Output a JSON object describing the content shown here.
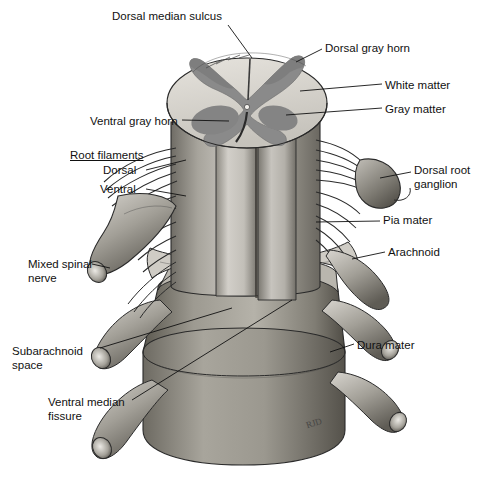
{
  "figure": {
    "background_color": "#ffffff",
    "signature": "RJD"
  },
  "palette": {
    "white_matter": "#d9d6d0",
    "gray_matter": "#8a8a8a",
    "cord_light": "#c9c6c0",
    "cord_mid": "#9c998f",
    "cord_dark": "#6d6a63",
    "dura": "#8e8b82",
    "dura_dark": "#4e4b45",
    "outline": "#2a2a2a",
    "leader": "#111111"
  },
  "labels": [
    {
      "id": "dorsal-median-sulcus",
      "text": "Dorsal median sulcus",
      "x": 112,
      "y": 10,
      "align": "left",
      "underline": false
    },
    {
      "id": "dorsal-gray-horn",
      "text": "Dorsal gray horn",
      "x": 325,
      "y": 42,
      "align": "left",
      "underline": false
    },
    {
      "id": "white-matter",
      "text": "White matter",
      "x": 385,
      "y": 79,
      "align": "left",
      "underline": false
    },
    {
      "id": "gray-matter",
      "text": "Gray matter",
      "x": 385,
      "y": 103,
      "align": "left",
      "underline": false
    },
    {
      "id": "ventral-gray-horn",
      "text": "Ventral gray horn",
      "x": 90,
      "y": 115,
      "align": "left",
      "underline": false
    },
    {
      "id": "root-filaments",
      "text": "Root filaments",
      "x": 70,
      "y": 149,
      "align": "left",
      "underline": true
    },
    {
      "id": "root-filaments-dorsal",
      "text": "Dorsal",
      "x": 103,
      "y": 170,
      "align": "left",
      "underline": false
    },
    {
      "id": "root-filaments-ventral",
      "text": "Ventral",
      "x": 100,
      "y": 189,
      "align": "left",
      "underline": false
    },
    {
      "id": "dorsal-root-ganglion",
      "text": "Dorsal root\nganglion",
      "x": 414,
      "y": 164,
      "align": "left",
      "underline": false
    },
    {
      "id": "pia-mater",
      "text": "Pia mater",
      "x": 383,
      "y": 216,
      "align": "left",
      "underline": false
    },
    {
      "id": "arachnoid",
      "text": "Arachnoid",
      "x": 388,
      "y": 247,
      "align": "left",
      "underline": false
    },
    {
      "id": "mixed-spinal-nerve",
      "text": "Mixed spinal\nnerve",
      "x": 28,
      "y": 258,
      "align": "left",
      "underline": false
    },
    {
      "id": "subarachnoid-space",
      "text": "Subarachnoid\nspace",
      "x": 12,
      "y": 345,
      "align": "left",
      "underline": false
    },
    {
      "id": "dura-mater",
      "text": "Dura mater",
      "x": 357,
      "y": 339,
      "align": "left",
      "underline": false
    },
    {
      "id": "ventral-median-fissure",
      "text": "Ventral median\nfissure",
      "x": 48,
      "y": 396,
      "align": "left",
      "underline": false
    }
  ],
  "structures": [
    {
      "id": "spinal-cord-cross-section",
      "name": "spinal cord cross section"
    },
    {
      "id": "white-matter-region",
      "name": "white matter"
    },
    {
      "id": "gray-matter-butterfly",
      "name": "gray matter butterfly"
    },
    {
      "id": "dorsal-gray-horn-left",
      "name": "dorsal gray horn"
    },
    {
      "id": "ventral-gray-horn-left",
      "name": "ventral gray horn"
    },
    {
      "id": "dorsal-median-sulcus-groove",
      "name": "dorsal median sulcus"
    },
    {
      "id": "ventral-median-fissure-groove",
      "name": "ventral median fissure"
    },
    {
      "id": "pia-mater-sheath",
      "name": "pia mater sheath"
    },
    {
      "id": "arachnoid-sheath",
      "name": "arachnoid sheath"
    },
    {
      "id": "dura-mater-sheath",
      "name": "dura mater sheath"
    },
    {
      "id": "dorsal-rootlets",
      "name": "dorsal root filaments"
    },
    {
      "id": "ventral-rootlets",
      "name": "ventral root filaments"
    },
    {
      "id": "dorsal-root-ganglion-body",
      "name": "dorsal root ganglion"
    },
    {
      "id": "mixed-spinal-nerve-trunk",
      "name": "mixed spinal nerve"
    },
    {
      "id": "subarachnoid-space-region",
      "name": "subarachnoid space"
    }
  ]
}
